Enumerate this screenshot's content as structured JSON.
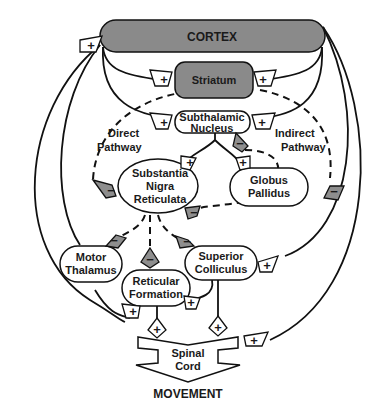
{
  "diagram": {
    "type": "basal ganglia circuit",
    "nodes": {
      "cortex": "CORTEX",
      "striatum": "Striatum",
      "stn_line1": "Subthalamic",
      "stn_line2": "Nucleus",
      "snr_line1": "Substantia",
      "snr_line2": "Nigra",
      "snr_line3": "Reticulata",
      "gp_line1": "Globus",
      "gp_line2": "Pallidus",
      "mt_line1": "Motor",
      "mt_line2": "Thalamus",
      "rf_line1": "Reticular",
      "rf_line2": "Formation",
      "sc_line1": "Superior",
      "sc_line2": "Colliculus",
      "sp_line1": "Spinal",
      "sp_line2": "Cord",
      "movement": "MOVEMENT"
    },
    "labels": {
      "direct_line1": "Direct",
      "direct_line2": "Pathway",
      "indirect_line1": "Indirect",
      "indirect_line2": "Pathway"
    },
    "signs": {
      "plus": "+",
      "minus": "−"
    },
    "colors": {
      "inhibitory_fill": "#8e8e8e",
      "cortex_fill": "#8a8a8a",
      "excitatory_fill": "#ffffff"
    }
  }
}
